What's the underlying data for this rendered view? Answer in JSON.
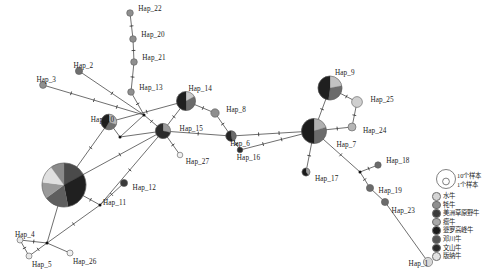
{
  "figure": {
    "type": "haplotype-network",
    "background": "#ffffff"
  },
  "palette": {
    "buffalo": "#d4d4d4",
    "yak": "#8f8f8f",
    "american_bison": "#3b3b3b",
    "zebu": "#a8a8a8",
    "brahman": "#1a1a1a",
    "dengchuan": "#555555",
    "wenshan": "#2a2a2a",
    "banna": "#e2e2e2",
    "edge": "#555555",
    "node_stroke": "#5a5a5a"
  },
  "legend": {
    "scale": {
      "large_label": "10个样本",
      "small_label": "1个样本"
    },
    "items": [
      {
        "label": "水牛",
        "color": "#d4d4d4"
      },
      {
        "label": "牦牛",
        "color": "#8f8f8f"
      },
      {
        "label": "美洲草原野牛",
        "color": "#3b3b3b"
      },
      {
        "label": "瘤牛",
        "color": "#a8a8a8"
      },
      {
        "label": "婆罗高峰牛",
        "color": "#1a1a1a"
      },
      {
        "label": "邓川牛",
        "color": "#555555"
      },
      {
        "label": "文山牛",
        "color": "#2a2a2a"
      },
      {
        "label": "版纳牛",
        "color": "#e2e2e2"
      }
    ]
  },
  "chart_data": {
    "type": "network",
    "nodes": [
      {
        "id": "Hap_22",
        "label": "Hap_22",
        "x": 130,
        "y": 13,
        "r": 3.3,
        "label_dx": 5,
        "label_dy": -4,
        "slices": [
          {
            "color": "#8f8f8f",
            "frac": 1
          }
        ]
      },
      {
        "id": "Hap_20",
        "label": "Hap_20",
        "x": 133,
        "y": 39,
        "r": 3.3,
        "label_dx": 5,
        "label_dy": -4,
        "slices": [
          {
            "color": "#8f8f8f",
            "frac": 1
          }
        ]
      },
      {
        "id": "Hap_21",
        "label": "Hap_21",
        "x": 134,
        "y": 62,
        "r": 3.3,
        "label_dx": 5,
        "label_dy": -4,
        "slices": [
          {
            "color": "#8f8f8f",
            "frac": 1
          }
        ]
      },
      {
        "id": "Hap_13",
        "label": "Hap_13",
        "x": 131,
        "y": 92,
        "r": 3.3,
        "label_dx": 5,
        "label_dy": -4,
        "slices": [
          {
            "color": "#8f8f8f",
            "frac": 1
          }
        ]
      },
      {
        "id": "Hap_2",
        "label": "Hap_2",
        "x": 79,
        "y": 71,
        "r": 3.6,
        "label_dx": -9,
        "label_dy": -5,
        "slices": [
          {
            "color": "#6f6f6f",
            "frac": 1
          }
        ]
      },
      {
        "id": "Hap_3",
        "label": "Hap_3",
        "x": 43,
        "y": 85,
        "r": 3.4,
        "label_dx": -10,
        "label_dy": -5,
        "slices": [
          {
            "color": "#8f8f8f",
            "frac": 1
          }
        ]
      },
      {
        "id": "Hap_14",
        "label": "Hap_14",
        "x": 186,
        "y": 101,
        "r": 9.5,
        "label_dx": -7,
        "label_dy": -12,
        "slices": [
          {
            "color": "#c9c9c9",
            "frac": 0.17
          },
          {
            "color": "#6b6b6b",
            "frac": 0.33
          },
          {
            "color": "#1f1f1f",
            "frac": 0.5
          }
        ]
      },
      {
        "id": "Hap_8",
        "label": "Hap_8",
        "x": 215,
        "y": 113,
        "r": 4.2,
        "label_dx": 7,
        "label_dy": -3,
        "slices": [
          {
            "color": "#8f8f8f",
            "frac": 1
          }
        ]
      },
      {
        "id": "Hap_15",
        "label": "Hap_15",
        "x": 163,
        "y": 131,
        "r": 7.6,
        "label_dx": 9,
        "label_dy": -2,
        "slices": [
          {
            "color": "#9a9a9a",
            "frac": 0.28
          },
          {
            "color": "#2b2b2b",
            "frac": 0.72
          }
        ]
      },
      {
        "id": "Hap_6",
        "label": "Hap_6",
        "x": 231,
        "y": 136,
        "r": 5.2,
        "label_dx": -6,
        "label_dy": 8,
        "slices": [
          {
            "color": "#6b6b6b",
            "frac": 0.45
          },
          {
            "color": "#262626",
            "frac": 0.55
          }
        ]
      },
      {
        "id": "Hap_27",
        "label": "Hap_27",
        "x": 180,
        "y": 155,
        "r": 2.8,
        "label_dx": 3,
        "label_dy": 7,
        "slices": [
          {
            "color": "#f0f0f0",
            "frac": 1
          }
        ]
      },
      {
        "id": "Hap_16",
        "label": "Hap_16",
        "x": 240,
        "y": 150,
        "r": 2.8,
        "label_dx": -6,
        "label_dy": 8,
        "slices": [
          {
            "color": "#2b2b2b",
            "frac": 1
          }
        ]
      },
      {
        "id": "Hap_10",
        "label": "Hap_10",
        "x": 109,
        "y": 122,
        "r": 7.8,
        "label_dx": -26,
        "label_dy": -2,
        "slices": [
          {
            "color": "#b5b5b5",
            "frac": 0.3
          },
          {
            "color": "#707070",
            "frac": 0.28
          },
          {
            "color": "#1f1f1f",
            "frac": 0.42
          }
        ]
      },
      {
        "id": "Hap_11",
        "label": "Hap_11",
        "x": 64,
        "y": 185,
        "r": 22,
        "label_dx": 17,
        "label_dy": 18,
        "slices": [
          {
            "color": "#4a4a4a",
            "frac": 0.17
          },
          {
            "color": "#202020",
            "frac": 0.3
          },
          {
            "color": "#5e5e5e",
            "frac": 0.18
          },
          {
            "color": "#9a9a9a",
            "frac": 0.12
          },
          {
            "color": "#e0e0e0",
            "frac": 0.13
          },
          {
            "color": "#8a8a8a",
            "frac": 0.1
          }
        ]
      },
      {
        "id": "Hap_12",
        "label": "Hap_12",
        "x": 124,
        "y": 183,
        "r": 3.6,
        "label_dx": 5,
        "label_dy": 5,
        "slices": [
          {
            "color": "#3a3a3a",
            "frac": 1
          }
        ]
      },
      {
        "id": "Hap_4",
        "label": "Hap_4",
        "x": 20,
        "y": 240,
        "r": 3.0,
        "label_dx": -8,
        "label_dy": -5,
        "slices": [
          {
            "color": "#e8e8e8",
            "frac": 1
          }
        ]
      },
      {
        "id": "Hap_5",
        "label": "Hap_5",
        "x": 29,
        "y": 256,
        "r": 3.0,
        "label_dx": 0,
        "label_dy": 9,
        "slices": [
          {
            "color": "#e8e8e8",
            "frac": 1
          }
        ]
      },
      {
        "id": "Hap_26",
        "label": "Hap_26",
        "x": 70,
        "y": 253,
        "r": 3.0,
        "label_dx": 0,
        "label_dy": 9,
        "slices": [
          {
            "color": "#f0f0f0",
            "frac": 1
          }
        ]
      },
      {
        "id": "Hap_9",
        "label": "Hap_9",
        "x": 330,
        "y": 88,
        "r": 12,
        "label_dx": -7,
        "label_dy": -15,
        "slices": [
          {
            "color": "#c2c2c2",
            "frac": 0.22
          },
          {
            "color": "#6b6b6b",
            "frac": 0.3
          },
          {
            "color": "#1f1f1f",
            "frac": 0.48
          }
        ]
      },
      {
        "id": "Hap_25",
        "label": "Hap_25",
        "x": 357,
        "y": 102,
        "r": 5.4,
        "label_dx": 8,
        "label_dy": -2,
        "slices": [
          {
            "color": "#cfcfcf",
            "frac": 1
          }
        ]
      },
      {
        "id": "Hap_24",
        "label": "Hap_24",
        "x": 352,
        "y": 127,
        "r": 4.0,
        "label_dx": 7,
        "label_dy": 4,
        "slices": [
          {
            "color": "#b5b5b5",
            "frac": 1
          }
        ]
      },
      {
        "id": "Hap_7",
        "label": "Hap_7",
        "x": 314,
        "y": 131,
        "r": 12.5,
        "label_dx": 10,
        "label_dy": 14,
        "slices": [
          {
            "color": "#b0b0b0",
            "frac": 0.2
          },
          {
            "color": "#6b6b6b",
            "frac": 0.3
          },
          {
            "color": "#1c1c1c",
            "frac": 0.5
          }
        ]
      },
      {
        "id": "Hap_17",
        "label": "Hap_17",
        "x": 306,
        "y": 172,
        "r": 4.0,
        "label_dx": 5,
        "label_dy": 7,
        "slices": [
          {
            "color": "#9a9a9a",
            "frac": 0.4
          },
          {
            "color": "#1a1a1a",
            "frac": 0.6
          }
        ]
      },
      {
        "id": "Hap_18",
        "label": "Hap_18",
        "x": 378,
        "y": 165,
        "r": 3.2,
        "label_dx": 5,
        "label_dy": -4,
        "slices": [
          {
            "color": "#6b6b6b",
            "frac": 1
          }
        ]
      },
      {
        "id": "Hap_19",
        "label": "Hap_19",
        "x": 370,
        "y": 188,
        "r": 3.6,
        "label_dx": 5,
        "label_dy": 3,
        "slices": [
          {
            "color": "#6b6b6b",
            "frac": 1
          }
        ]
      },
      {
        "id": "Hap_23",
        "label": "Hap_23",
        "x": 385,
        "y": 202,
        "r": 3.6,
        "label_dx": 3,
        "label_dy": 9,
        "slices": [
          {
            "color": "#6b6b6b",
            "frac": 1
          }
        ]
      },
      {
        "id": "Hap_1",
        "label": "Hap_1",
        "x": 428,
        "y": 262,
        "r": 4.6,
        "label_dx": -24,
        "label_dy": 2,
        "slices": [
          {
            "color": "#d8d8d8",
            "frac": 1
          }
        ]
      }
    ],
    "junctions": [
      {
        "id": "j_a",
        "x": 144,
        "y": 115
      },
      {
        "id": "j_b",
        "x": 120,
        "y": 137
      },
      {
        "id": "j_c",
        "x": 100,
        "y": 205
      },
      {
        "id": "j_d",
        "x": 47,
        "y": 243
      },
      {
        "id": "j_e",
        "x": 360,
        "y": 172
      }
    ],
    "edges": [
      {
        "from": "Hap_22",
        "to": "Hap_20",
        "ticks": 1
      },
      {
        "from": "Hap_20",
        "to": "Hap_21",
        "ticks": 1
      },
      {
        "from": "Hap_21",
        "to": "Hap_13",
        "ticks": 1
      },
      {
        "from": "Hap_13",
        "to": "j_a",
        "ticks": 1
      },
      {
        "from": "Hap_3",
        "to": "j_a",
        "ticks": 3
      },
      {
        "from": "Hap_2",
        "to": "j_a",
        "ticks": 1
      },
      {
        "from": "j_a",
        "to": "Hap_15",
        "ticks": 1
      },
      {
        "from": "j_a",
        "to": "j_b",
        "ticks": 0
      },
      {
        "from": "j_b",
        "to": "Hap_15",
        "ticks": 0
      },
      {
        "from": "j_b",
        "to": "Hap_10",
        "ticks": 0
      },
      {
        "from": "Hap_10",
        "to": "Hap_14",
        "ticks": 1
      },
      {
        "from": "Hap_14",
        "to": "Hap_15",
        "ticks": 1
      },
      {
        "from": "Hap_14",
        "to": "Hap_8",
        "ticks": 1
      },
      {
        "from": "Hap_8",
        "to": "Hap_6",
        "ticks": 1
      },
      {
        "from": "Hap_15",
        "to": "Hap_6",
        "ticks": 1
      },
      {
        "from": "Hap_15",
        "to": "Hap_27",
        "ticks": 1
      },
      {
        "from": "Hap_15",
        "to": "j_c",
        "ticks": 1
      },
      {
        "from": "Hap_10",
        "to": "Hap_11",
        "ticks": 1
      },
      {
        "from": "Hap_11",
        "to": "Hap_15",
        "ticks": 1
      },
      {
        "from": "Hap_6",
        "to": "Hap_16",
        "ticks": 1
      },
      {
        "from": "Hap_16",
        "to": "Hap_7",
        "ticks": 2
      },
      {
        "from": "Hap_6",
        "to": "Hap_7",
        "ticks": 2
      },
      {
        "from": "Hap_7",
        "to": "Hap_9",
        "ticks": 1
      },
      {
        "from": "Hap_9",
        "to": "Hap_25",
        "ticks": 1
      },
      {
        "from": "Hap_25",
        "to": "Hap_24",
        "ticks": 1
      },
      {
        "from": "Hap_24",
        "to": "Hap_7",
        "ticks": 1
      },
      {
        "from": "Hap_7",
        "to": "Hap_17",
        "ticks": 1
      },
      {
        "from": "Hap_7",
        "to": "j_e",
        "ticks": 1
      },
      {
        "from": "j_e",
        "to": "Hap_18",
        "ticks": 1
      },
      {
        "from": "j_e",
        "to": "Hap_19",
        "ticks": 1
      },
      {
        "from": "Hap_19",
        "to": "Hap_23",
        "ticks": 0
      },
      {
        "from": "Hap_23",
        "to": "Hap_1",
        "ticks": 0
      },
      {
        "from": "Hap_12",
        "to": "j_c",
        "ticks": 1
      },
      {
        "from": "j_c",
        "to": "Hap_11",
        "ticks": 1
      },
      {
        "from": "j_c",
        "to": "j_d",
        "ticks": 1
      },
      {
        "from": "j_d",
        "to": "Hap_4",
        "ticks": 1
      },
      {
        "from": "j_d",
        "to": "Hap_5",
        "ticks": 1
      },
      {
        "from": "Hap_4",
        "to": "Hap_5",
        "ticks": 1
      },
      {
        "from": "j_d",
        "to": "Hap_26",
        "ticks": 0
      },
      {
        "from": "Hap_11",
        "to": "j_d",
        "ticks": 0
      }
    ]
  }
}
